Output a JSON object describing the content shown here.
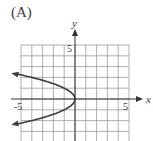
{
  "option": {
    "label": "(A)"
  },
  "chart_data": {
    "type": "line",
    "title": "(A)",
    "xlabel": "x",
    "ylabel": "y",
    "xlim": [
      -5,
      5
    ],
    "ylim": [
      -5,
      5
    ],
    "grid": true,
    "grid_step": 1,
    "tick_labels": {
      "x": [
        "-5",
        "5"
      ],
      "y": [
        "5"
      ]
    },
    "series": [
      {
        "name": "x = -y^2",
        "equation": "x = -y^2",
        "description": "Parabola opening left with vertex at origin, arrows on both ends",
        "points": [
          {
            "x": -5.8,
            "y": 2.4
          },
          {
            "x": -4,
            "y": 2
          },
          {
            "x": -2.25,
            "y": 1.5
          },
          {
            "x": -1,
            "y": 1
          },
          {
            "x": -0.25,
            "y": 0.5
          },
          {
            "x": 0,
            "y": 0
          },
          {
            "x": -0.25,
            "y": -0.5
          },
          {
            "x": -1,
            "y": -1
          },
          {
            "x": -2.25,
            "y": -1.5
          },
          {
            "x": -4,
            "y": -2
          },
          {
            "x": -5.8,
            "y": -2.4
          }
        ],
        "color": "#3d3d3d"
      }
    ],
    "colors": {
      "grid": "#9a9a9a",
      "axis": "#333333",
      "curve": "#3d3d3d",
      "text": "#3a3a3a"
    }
  }
}
